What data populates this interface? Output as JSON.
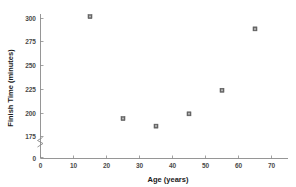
{
  "chart_data": {
    "type": "scatter",
    "title": "",
    "xlabel": "Age (years)",
    "ylabel": "Finish Time (minutes)",
    "xlim": [
      0,
      75
    ],
    "ylim": [
      175,
      310
    ],
    "grid": false,
    "legend": null,
    "axis_break_y": true,
    "x_ticks": [
      "0",
      "10",
      "20",
      "30",
      "40",
      "50",
      "60",
      "70"
    ],
    "x_tick_values": [
      0,
      10,
      20,
      30,
      40,
      50,
      60,
      70
    ],
    "y_ticks": [
      "0",
      "175",
      "200",
      "225",
      "250",
      "275",
      "300"
    ],
    "y_tick_values": [
      0,
      175,
      200,
      225,
      250,
      275,
      300
    ],
    "points": [
      {
        "x": 15,
        "y": 302
      },
      {
        "x": 25,
        "y": 194
      },
      {
        "x": 35,
        "y": 186
      },
      {
        "x": 45,
        "y": 199
      },
      {
        "x": 55,
        "y": 224
      },
      {
        "x": 65,
        "y": 289
      }
    ],
    "marker": "square-dot",
    "marker_color": "#6e6e6e",
    "axis_color": "#8a8a8a",
    "text_color": "#1a1a1a"
  }
}
